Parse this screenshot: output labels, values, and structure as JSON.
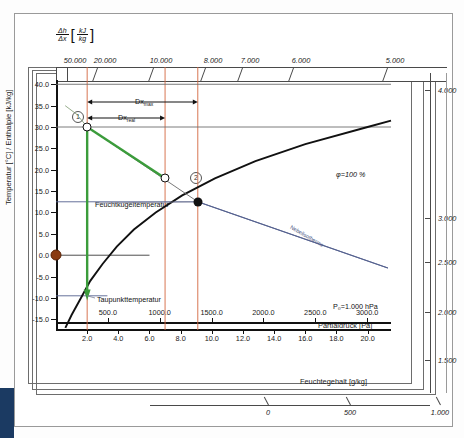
{
  "chart_data": {
    "type": "line",
    "xlabel": "Feuchtegehalt [g/kg]",
    "ylabel": "Temperatur [°C] / Enthalpie [kJ/kg]",
    "xlim": [
      0,
      21.5
    ],
    "ylim": [
      -17.5,
      41.0
    ],
    "grid": false,
    "legend": "none",
    "y_ticks": [
      "40.0",
      "35.0",
      "30.0",
      "25.0",
      "20.0",
      "15.0",
      "10.0",
      "5.0",
      "0.0",
      "-5.0",
      "-10.0",
      "-15.0"
    ],
    "y_tick_values": [
      40.0,
      35.0,
      30.0,
      25.0,
      20.0,
      15.0,
      10.0,
      5.0,
      0.0,
      -5.0,
      -10.0,
      -15.0
    ],
    "x_ticks": [
      "2.0",
      "4.0",
      "6.0",
      "8.0",
      "10.0",
      "12.0",
      "14.0",
      "16.0",
      "18.0",
      "20.0"
    ],
    "x_tick_values": [
      2.0,
      4.0,
      6.0,
      8.0,
      10.0,
      12.0,
      14.0,
      16.0,
      18.0,
      20.0
    ],
    "secondary_x_axis": {
      "label": "Partialdruck [Pa]",
      "ticks": [
        "500.0",
        "1000.0",
        "1500.0",
        "2000.0",
        "2500.0",
        "3000.0"
      ],
      "tick_values": [
        500,
        1000,
        1500,
        2000,
        2500,
        3000
      ]
    },
    "top_axis": {
      "label_numerator": "Δh",
      "label_denominator": "Δx",
      "unit_numerator": "kJ",
      "unit_denominator": "kg",
      "ticks": [
        "50.000",
        "20.000",
        "10.000",
        "8.000",
        "7.000",
        "6.000",
        "5.000"
      ],
      "tick_values": [
        50000,
        20000,
        10000,
        8000,
        7000,
        6000,
        5000
      ]
    },
    "right_axis": {
      "ticks": [
        "4.000",
        "3.000",
        "2.500",
        "2.000",
        "1.500"
      ],
      "tick_values": [
        4000,
        3000,
        2500,
        2000,
        1500
      ]
    },
    "bottom_axis": {
      "ticks": [
        "0",
        "500",
        "1.000"
      ],
      "tick_values": [
        0,
        500,
        1000
      ]
    },
    "series": [
      {
        "name": "φ=100 % Sättigungslinie",
        "color": "#111111",
        "points": [
          [
            0.6,
            -17.0
          ],
          [
            1.0,
            -14.0
          ],
          [
            1.6,
            -10.0
          ],
          [
            2.2,
            -6.0
          ],
          [
            3.0,
            -2.0
          ],
          [
            3.9,
            2.0
          ],
          [
            5.0,
            6.0
          ],
          [
            6.4,
            10.0
          ],
          [
            8.1,
            14.0
          ],
          [
            10.2,
            18.0
          ],
          [
            12.8,
            22.0
          ],
          [
            16.0,
            26.0
          ],
          [
            20.0,
            30.0
          ],
          [
            21.5,
            31.5
          ]
        ]
      },
      {
        "name": "Nebelisotherme",
        "color": "#55618f",
        "points": [
          [
            9.1,
            12.5
          ],
          [
            21.3,
            -3.0
          ]
        ]
      },
      {
        "name": "Zustandsänderung 1 → 2",
        "color": "#3b9c3b",
        "points": [
          [
            2.0,
            30.0
          ],
          [
            7.0,
            18.0
          ]
        ]
      }
    ],
    "annotations": {
      "phi_100": "φ=100 %",
      "nebelisotherme": "Nebelisotherme",
      "pb": "P₀=1.000 hPa",
      "feuchtkugel": "Feuchtkugeltemperatur",
      "taupunkt": "Taupunkttemperatur",
      "dx_upper": "Dx",
      "dx_upper_sub": "max",
      "dx_lower": "Dx",
      "dx_lower_sub": "real",
      "point1": "1",
      "point2": "2"
    },
    "markers": [
      {
        "name": "point-1",
        "label": "1",
        "x": 2.0,
        "y": 30.0,
        "style": "open-circle"
      },
      {
        "name": "point-2",
        "label": "2",
        "x": 7.0,
        "y": 18.0,
        "style": "open-circle"
      },
      {
        "name": "saturation-point",
        "label": "",
        "x": 9.1,
        "y": 12.5,
        "style": "solid-dot"
      },
      {
        "name": "zero-point",
        "label": "",
        "x": 0.0,
        "y": 0.0,
        "style": "brown-dot"
      }
    ],
    "construction_lines": {
      "vertical_x_values": [
        2.0,
        7.0,
        9.1
      ],
      "vertical_color": "#d4673f",
      "horizontal_values": [
        {
          "y": 40.0,
          "color": "#6d6d6d"
        },
        {
          "y": 30.0,
          "color": "#6d6d6d"
        },
        {
          "y": 12.5,
          "color": "#55618f"
        },
        {
          "y": 0.0,
          "color": "#3a3a3a"
        },
        {
          "y": -9.5,
          "color": "#55618f"
        }
      ]
    }
  }
}
